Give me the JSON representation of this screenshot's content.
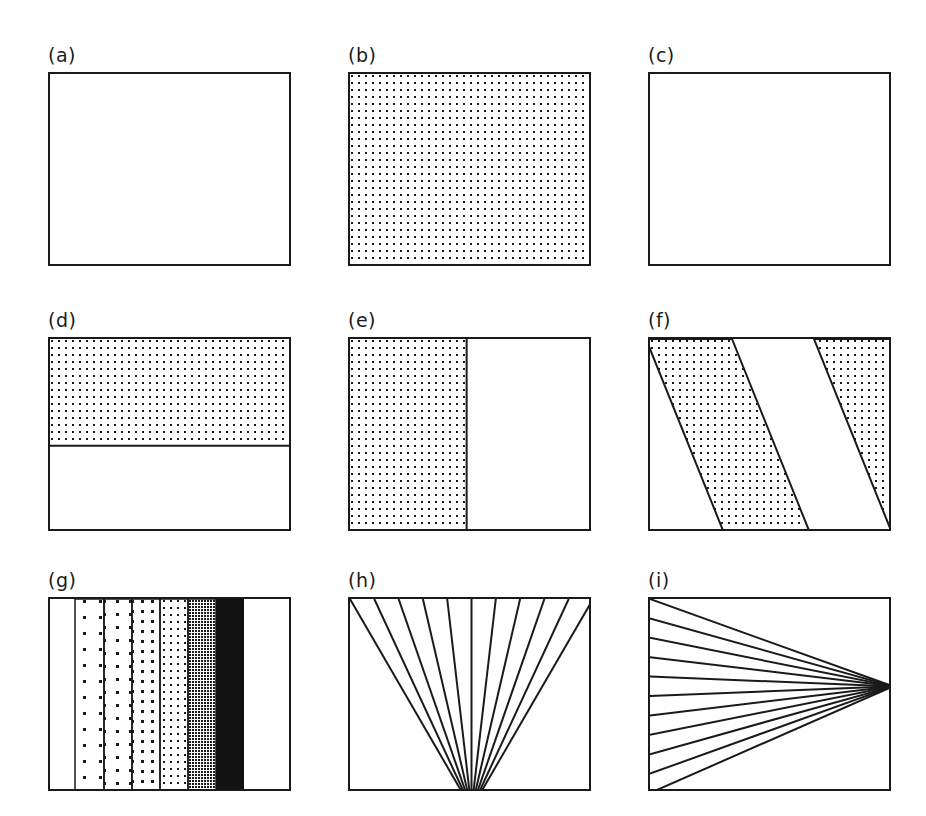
{
  "figure": {
    "width": 926,
    "height": 816,
    "background": "#ffffff",
    "stroke_color": "#1a1a1a",
    "fill_dot_color": "#1a1a1a",
    "solid_fill_color": "#111111",
    "box_width": 243,
    "box_height": 194,
    "columns": 3,
    "rows": 3,
    "col_x": [
      48,
      348,
      648
    ],
    "row_y": [
      46,
      311,
      571
    ]
  },
  "panels": [
    {
      "id": "a",
      "label": "(a)",
      "type": "empty",
      "description": "empty rectangle outline"
    },
    {
      "id": "b",
      "label": "(b)",
      "type": "dot-fill-full",
      "description": "rectangle fully filled with regular square dot grid",
      "dot_spacing": 7,
      "dot_size": 2
    },
    {
      "id": "c",
      "label": "(c)",
      "type": "empty",
      "description": "empty rectangle outline"
    },
    {
      "id": "d",
      "label": "(d)",
      "type": "horizontal-band",
      "description": "dotted horizontal band across top portion with divider line",
      "band_top_pct": 0,
      "band_bottom_pct": 55,
      "dot_spacing": 7,
      "dot_size": 2
    },
    {
      "id": "e",
      "label": "(e)",
      "type": "vertical-band",
      "description": "dotted vertical band on left portion with divider line",
      "band_left_pct": 0,
      "band_right_pct": 48,
      "dot_spacing": 7,
      "dot_size": 2
    },
    {
      "id": "f",
      "label": "(f)",
      "type": "diagonal-bands",
      "description": "two parallel dotted diagonal bands slanting down to the right",
      "band_count": 2,
      "slant_dx": 78,
      "band_width": 86,
      "band_gap": 82,
      "dot_spacing": 7,
      "dot_size": 2
    },
    {
      "id": "g",
      "label": "(g)",
      "type": "density-ramp",
      "description": "six vertical bands of increasing dot density from sparse to solid black",
      "band_count": 6,
      "band_edges": [
        25,
        54,
        82,
        110,
        138,
        166,
        194
      ],
      "densities": [
        "sparse",
        "light",
        "medium",
        "dense",
        "very-dense",
        "solid"
      ],
      "dot_spacings": [
        16,
        13,
        10,
        7,
        3,
        0
      ]
    },
    {
      "id": "h",
      "label": "(h)",
      "type": "line-fan",
      "description": "fan of straight lines radiating from a focus below bottom-center up to the top edge",
      "line_count": 11,
      "focus_x_pct": 50,
      "focus_y_pct": 108
    },
    {
      "id": "i",
      "label": "(i)",
      "type": "line-fan",
      "description": "fan of straight lines converging to a focus at the right edge, spreading across the left edge",
      "line_count": 11,
      "focus_x_pct": 100,
      "focus_y_pct": 45
    }
  ]
}
